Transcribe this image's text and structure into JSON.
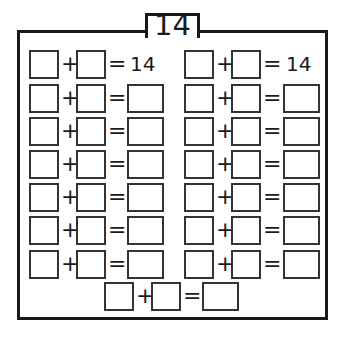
{
  "worksheet": {
    "title": "14",
    "target_sum": "14",
    "plus_symbol": "+",
    "equals_symbol": "=",
    "left_column": {
      "rows": [
        {
          "result": "14"
        },
        {
          "result": ""
        },
        {
          "result": ""
        },
        {
          "result": ""
        },
        {
          "result": ""
        },
        {
          "result": ""
        },
        {
          "result": ""
        }
      ]
    },
    "right_column": {
      "rows": [
        {
          "result": "14"
        },
        {
          "result": ""
        },
        {
          "result": ""
        },
        {
          "result": ""
        },
        {
          "result": ""
        },
        {
          "result": ""
        },
        {
          "result": ""
        }
      ]
    },
    "bottom_row": {
      "result": ""
    },
    "colors": {
      "line": "#1a1a1a",
      "background": "#ffffff"
    }
  }
}
